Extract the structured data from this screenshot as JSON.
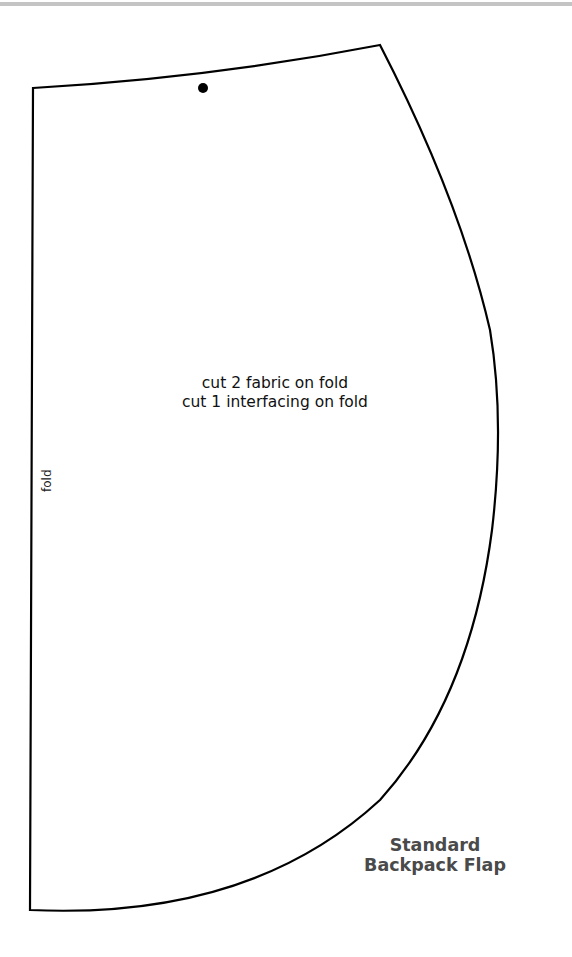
{
  "pattern": {
    "title_line1": "Standard",
    "title_line2": "Backpack Flap",
    "instructions": [
      "cut 2 fabric on fold",
      "cut 1 interfacing on fold"
    ],
    "fold_label": "fold",
    "colors": {
      "outline": "#000000",
      "title": "#4a4a4a",
      "top_rule": "#c4c4c4"
    }
  }
}
